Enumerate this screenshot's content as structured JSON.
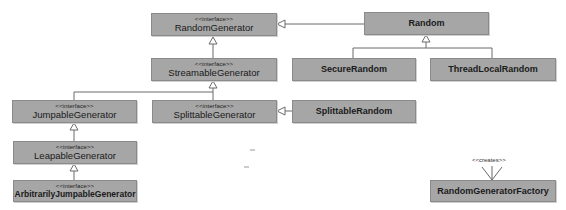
{
  "diagram": {
    "type": "uml-class-diagram",
    "stereotype_label": "<<interface>>",
    "creates_label": "<<creates>>",
    "colors": {
      "box_fill": "#a6a6a6",
      "box_border": "#8a8a8a",
      "line": "#6a6a6a",
      "background": "#ffffff"
    },
    "nodes": {
      "random_generator": {
        "name": "RandomGenerator",
        "interface": true
      },
      "random": {
        "name": "Random",
        "interface": false
      },
      "secure_random": {
        "name": "SecureRandom",
        "interface": false
      },
      "thread_local_random": {
        "name": "ThreadLocalRandom",
        "interface": false
      },
      "streamable_generator": {
        "name": "StreamableGenerator",
        "interface": true
      },
      "jumpable_generator": {
        "name": "JumpableGenerator",
        "interface": true
      },
      "splittable_generator": {
        "name": "SplittableGenerator",
        "interface": true
      },
      "splittable_random": {
        "name": "SplittableRandom",
        "interface": false
      },
      "leapable_generator": {
        "name": "LeapableGenerator",
        "interface": true
      },
      "arbitrarily_jumpable_generator": {
        "name": "ArbitrarilyJumpableGenerator",
        "interface": true
      },
      "random_generator_factory": {
        "name": "RandomGeneratorFactory",
        "interface": false
      }
    },
    "edges": [
      {
        "from": "Random",
        "to": "RandomGenerator",
        "kind": "realization"
      },
      {
        "from": "SecureRandom",
        "to": "Random",
        "kind": "generalization"
      },
      {
        "from": "ThreadLocalRandom",
        "to": "Random",
        "kind": "generalization"
      },
      {
        "from": "StreamableGenerator",
        "to": "RandomGenerator",
        "kind": "generalization"
      },
      {
        "from": "JumpableGenerator",
        "to": "StreamableGenerator",
        "kind": "generalization"
      },
      {
        "from": "SplittableGenerator",
        "to": "StreamableGenerator",
        "kind": "generalization"
      },
      {
        "from": "SplittableRandom",
        "to": "SplittableGenerator",
        "kind": "realization"
      },
      {
        "from": "LeapableGenerator",
        "to": "JumpableGenerator",
        "kind": "generalization"
      },
      {
        "from": "ArbitrarilyJumpableGenerator",
        "to": "LeapableGenerator",
        "kind": "generalization"
      },
      {
        "from": "RandomGeneratorFactory",
        "to": "(instances)",
        "kind": "creates"
      }
    ]
  }
}
